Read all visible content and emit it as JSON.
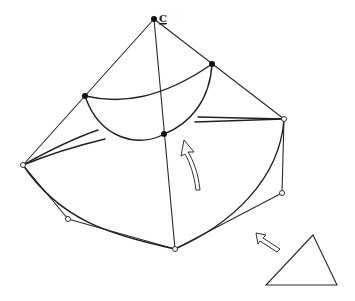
{
  "diagram": {
    "type": "surface patch with control net",
    "apex_label": "C",
    "points": {
      "apex": [
        154,
        19
      ],
      "upper_left": [
        85,
        96
      ],
      "upper_right": [
        212,
        64
      ],
      "center": [
        164,
        134
      ],
      "left": [
        23,
        165
      ],
      "right": [
        284,
        119
      ],
      "bottom_left_ctrl": [
        68,
        219
      ],
      "bottom": [
        175,
        249
      ],
      "bottom_right_ctrl": [
        282,
        193
      ]
    },
    "filled_points": [
      "apex",
      "upper_left",
      "upper_right",
      "center"
    ],
    "hollow_points": [
      "left",
      "right",
      "bottom_left_ctrl",
      "bottom",
      "bottom_right_ctrl"
    ],
    "annotations": {
      "curved_arrow": "rotation arrow pointing up",
      "straight_arrow": "arrow pointing up-left toward patch",
      "triangle": "parameter domain triangle"
    },
    "colors": {
      "line": "#2a2a2a",
      "background": "#ffffff"
    }
  }
}
